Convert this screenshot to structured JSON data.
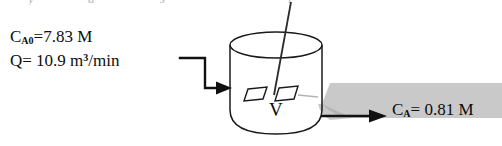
{
  "figure": {
    "background_color": "#ffffff",
    "ink_color": "#1a1a1a",
    "shadow_color": "#a8a8a8"
  },
  "clipped_header": {
    "glyph_1": "y",
    "glyph_2": "a",
    "glyph_3": "s",
    "glyph_4": "l"
  },
  "feed": {
    "concentration_symbol": "C",
    "concentration_subscript": "A0",
    "concentration_equals": "=7.83 M",
    "flow_symbol": "Q",
    "flow_equals": "= 10.9 m",
    "flow_exponent": "3",
    "flow_units": "/min"
  },
  "vessel": {
    "volume_label": "V"
  },
  "outlet": {
    "concentration_symbol": "C",
    "concentration_subscript": "A",
    "concentration_value": "= 0.81 M"
  },
  "icons": {
    "inlet_arrow": "inlet-flow-arrow-icon",
    "outlet_arrow": "outlet-flow-arrow-icon",
    "impeller": "impeller-icon"
  }
}
